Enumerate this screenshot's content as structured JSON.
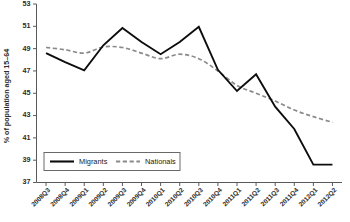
{
  "chart_data": {
    "type": "line",
    "title": "",
    "xlabel": "",
    "ylabel": "% of population aged 15–64",
    "ylim": [
      37,
      53
    ],
    "ytick_step": 2,
    "yticks": [
      37,
      39,
      41,
      43,
      45,
      47,
      49,
      51,
      53
    ],
    "grid": false,
    "legend_position": "bottom-left",
    "categories": [
      "2008Q3",
      "2008Q4",
      "2009Q1",
      "2009Q2",
      "2009Q3",
      "2009Q4",
      "2010Q1",
      "2010Q2",
      "2010Q3",
      "2010Q4",
      "2011Q1",
      "2011Q2",
      "2011Q3",
      "2011Q4",
      "2012Q1",
      "2012Q2"
    ],
    "series": [
      {
        "name": "Migrants",
        "style": "solid",
        "color": "#0d0d0d",
        "values": [
          48.6,
          47.8,
          47.05,
          49.3,
          50.85,
          49.6,
          48.5,
          49.6,
          50.95,
          47.1,
          45.2,
          46.7,
          43.8,
          41.8,
          38.6,
          38.6
        ]
      },
      {
        "name": "Nationals",
        "style": "dashed",
        "color": "#8a8a8a",
        "values": [
          49.1,
          48.9,
          48.6,
          49.15,
          49.1,
          48.6,
          48.1,
          48.5,
          48.1,
          47.0,
          45.7,
          45.0,
          44.3,
          43.5,
          42.9,
          42.4
        ]
      }
    ]
  },
  "legend": {
    "items": [
      {
        "label": "Migrants"
      },
      {
        "label": "Nationals"
      }
    ]
  },
  "axis": {
    "y_title": "% of population aged 15–64"
  }
}
